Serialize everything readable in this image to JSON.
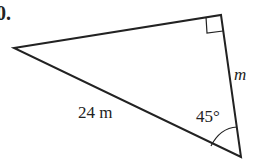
{
  "problem_number": "0.",
  "triangle": {
    "hypotenuse_label": "24 m",
    "unknown_side_label": "m",
    "angle_label": "45°",
    "right_angle": true
  },
  "colors": {
    "stroke": "#222222",
    "background": "#ffffff"
  }
}
